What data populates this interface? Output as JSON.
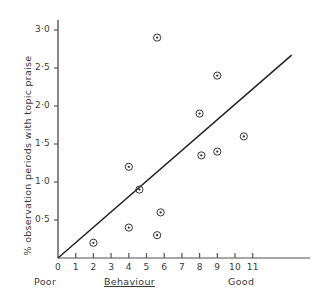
{
  "chart_data": {
    "type": "scatter",
    "title": "",
    "xlabel": "Behaviour",
    "ylabel": "% observation periods with topic praise",
    "xlim": [
      0,
      11.8
    ],
    "ylim": [
      0,
      3.25
    ],
    "grid": false,
    "legend": null,
    "x_axis": {
      "label": "Behaviour",
      "low_end_caption": "Poor",
      "high_end_caption": "Good",
      "ticks": [
        0,
        1,
        2,
        3,
        4,
        5,
        6,
        7,
        8,
        9,
        10,
        11
      ],
      "tick_labels": [
        "0",
        "1",
        "2",
        "3",
        "4",
        "5",
        "6",
        "7",
        "8",
        "9",
        "10",
        "11"
      ]
    },
    "y_axis": {
      "label": "% observation periods with topic praise",
      "ticks": [
        0.5,
        1.0,
        1.5,
        2.0,
        2.5,
        3.0
      ],
      "tick_labels": [
        "0·5",
        "1·0",
        "1·5",
        "2·0",
        "2·5",
        "3·0"
      ]
    },
    "points": [
      {
        "x": 2.0,
        "y": 0.2
      },
      {
        "x": 4.0,
        "y": 1.2
      },
      {
        "x": 4.0,
        "y": 0.4
      },
      {
        "x": 4.6,
        "y": 0.9
      },
      {
        "x": 5.6,
        "y": 0.3
      },
      {
        "x": 5.8,
        "y": 0.6
      },
      {
        "x": 5.6,
        "y": 2.9
      },
      {
        "x": 8.0,
        "y": 1.9
      },
      {
        "x": 8.1,
        "y": 1.35
      },
      {
        "x": 9.0,
        "y": 2.4
      },
      {
        "x": 9.0,
        "y": 1.4
      },
      {
        "x": 10.5,
        "y": 1.6
      }
    ],
    "trend_line": {
      "type": "line",
      "x_start": 0.0,
      "y_start": 0.0,
      "x_end": 13.2,
      "y_end": 2.67
    }
  }
}
